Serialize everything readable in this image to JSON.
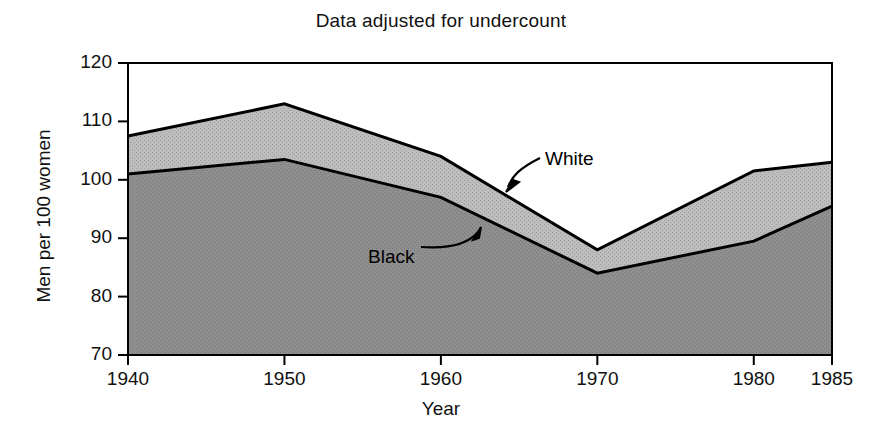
{
  "chart_data": {
    "type": "area",
    "title": "Data adjusted for undercount",
    "xlabel": "Year",
    "ylabel": "Men per 100 women",
    "x": [
      1940,
      1950,
      1960,
      1970,
      1980,
      1985
    ],
    "xtick_labels": [
      "1940",
      "1950",
      "1960",
      "1970",
      "1980",
      "1985"
    ],
    "ytick_labels": [
      "70",
      "80",
      "90",
      "100",
      "110",
      "120"
    ],
    "yticks": [
      70,
      80,
      90,
      100,
      110,
      120
    ],
    "xlim": [
      1940,
      1985
    ],
    "ylim": [
      70,
      120
    ],
    "grid": false,
    "legend_position": "inline-annotations",
    "stacked": false,
    "series": [
      {
        "name": "White",
        "values": [
          107.5,
          113.0,
          104.0,
          88.0,
          101.5,
          103.0
        ],
        "fill_color": "#b9b9b9",
        "line_color": "#000000"
      },
      {
        "name": "Black",
        "values": [
          101.0,
          103.5,
          97.0,
          84.0,
          89.5,
          95.5
        ],
        "fill_color": "#8c8c8c",
        "line_color": "#000000"
      }
    ],
    "annotations": [
      {
        "text": "White",
        "label_x": 545,
        "label_y": 148
      },
      {
        "text": "Black",
        "label_x": 368,
        "label_y": 246
      }
    ]
  },
  "colors": {
    "background": "#ffffff",
    "axis": "#000000",
    "text": "#111111",
    "white_band": "#b9b9b9",
    "black_band": "#8c8c8c"
  }
}
